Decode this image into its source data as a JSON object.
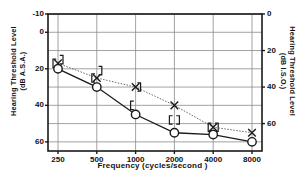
{
  "chart_data": {
    "type": "line",
    "title": "",
    "xlabel": "Frequency (cycles/second )",
    "ylabel_left_line1": "Hearing Threshold  Level",
    "ylabel_left_line2": "(dB A.S.A.)",
    "ylabel_right_line1": "Hearing Threshold Level",
    "ylabel_right_line2": "(dB I.S.O.)",
    "x_scale": "log",
    "categories": [
      250,
      500,
      1000,
      2000,
      4000,
      8000
    ],
    "xtick_labels": [
      "250",
      "500",
      "1000",
      "2000",
      "4000",
      "8000"
    ],
    "ylim_left": [
      -10,
      65
    ],
    "ytick_values_left": [
      -10,
      0,
      20,
      40,
      60
    ],
    "ytick_labels_left": [
      "-10",
      "0",
      "20",
      "40",
      "60"
    ],
    "ytick_values_right_in_asa": [
      -10,
      10,
      30,
      50
    ],
    "ytick_labels_right": [
      "0",
      "20",
      "40",
      "60"
    ],
    "gridlines": true,
    "grid_step_db": 10,
    "legend": "none",
    "series": [
      {
        "name": "air-conduction-left-masked",
        "marker": "x",
        "line_style": "dotted",
        "values": [
          17,
          25,
          30,
          40,
          52,
          55
        ]
      },
      {
        "name": "air-conduction-right",
        "marker": "circle",
        "line_style": "solid",
        "values": [
          20,
          30,
          45,
          55,
          56,
          60
        ]
      }
    ],
    "bracket_markers": [
      {
        "frequency": 250,
        "value": 15,
        "type": "right-bracket"
      },
      {
        "frequency": 250,
        "value": 17,
        "type": "left-bracket"
      },
      {
        "frequency": 500,
        "value": 21,
        "type": "right-bracket"
      },
      {
        "frequency": 500,
        "value": 25,
        "type": "left-bracket"
      },
      {
        "frequency": 1000,
        "value": 30,
        "type": "right-bracket"
      },
      {
        "frequency": 1000,
        "value": 40,
        "type": "left-bracket"
      },
      {
        "frequency": 2000,
        "value": 48,
        "type": "left-bracket"
      },
      {
        "frequency": 2000,
        "value": 48,
        "type": "right-bracket"
      },
      {
        "frequency": 4000,
        "value": 52,
        "type": "left-bracket"
      },
      {
        "frequency": 4000,
        "value": 52,
        "type": "right-bracket"
      }
    ],
    "colors": {
      "axis": "#1a1a1a",
      "grid": "#8a8a8a",
      "series_solid": "#1a1a1a",
      "series_dotted": "#555555",
      "background": "#ffffff"
    }
  }
}
